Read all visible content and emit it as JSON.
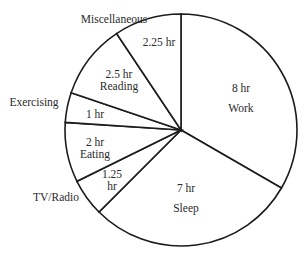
{
  "chart_data": {
    "type": "pie",
    "title": "",
    "unit": "hr",
    "total": 24,
    "start_angle_deg": 0,
    "direction": "clockwise",
    "slices": [
      {
        "name": "Work",
        "value": 8,
        "value_label": "8 hr",
        "label_inside": true
      },
      {
        "name": "Sleep",
        "value": 7,
        "value_label": "7 hr",
        "label_inside": true
      },
      {
        "name": "TV/Radio",
        "value": 1.25,
        "value_label": "1.25 hr",
        "label_inside": false
      },
      {
        "name": "Eating",
        "value": 2,
        "value_label": "2 hr",
        "label_inside": true
      },
      {
        "name": "Exercising",
        "value": 1,
        "value_label": "1 hr",
        "label_inside": false
      },
      {
        "name": "Reading",
        "value": 2.5,
        "value_label": "2.5 hr",
        "label_inside": true
      },
      {
        "name": "Miscellaneous",
        "value": 2.25,
        "value_label": "2.25 hr",
        "label_inside": false
      }
    ],
    "colors": {
      "fill": "#ffffff",
      "stroke": "#1c1c1c",
      "text": "#2a2a2a"
    }
  },
  "labels": {
    "work_value": "8 hr",
    "work_name": "Work",
    "sleep_value": "7 hr",
    "sleep_name": "Sleep",
    "tv_value_1": "1.25",
    "tv_value_2": "hr",
    "tv_name": "TV/Radio",
    "eating_value": "2 hr",
    "eating_name": "Eating",
    "exercising_value": "1 hr",
    "exercising_name": "Exercising",
    "reading_value": "2.5 hr",
    "reading_name": "Reading",
    "misc_value": "2.25 hr",
    "misc_name": "Miscellaneous"
  }
}
